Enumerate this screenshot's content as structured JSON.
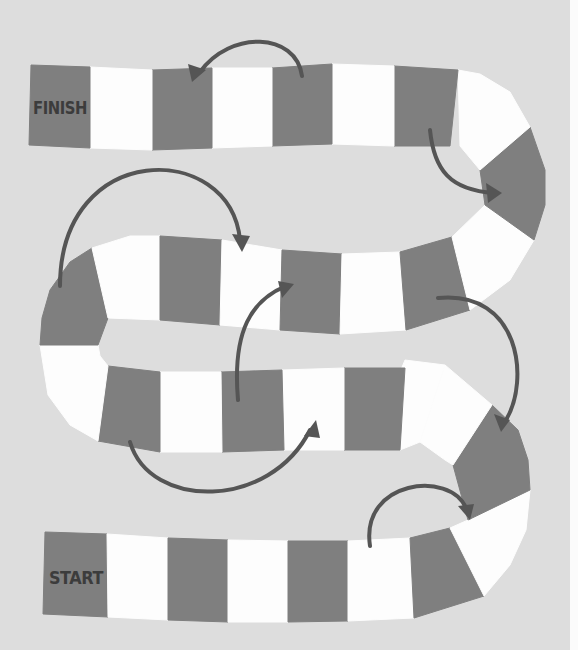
{
  "colors": {
    "background": "#dddddd",
    "dark_tile": "#7f7f7f",
    "light_tile": "#fdfdfd",
    "arrow": "#555555",
    "label": "#3c3c3c"
  },
  "labels": {
    "finish": "FINISH",
    "start": "START"
  },
  "tiles": [
    {
      "id": "start",
      "color": "dark",
      "points": "45,532 107,534 108,617 43,614",
      "label": "start"
    },
    {
      "id": "r4-2",
      "color": "light",
      "points": "107,534 168,538 168,620 108,617"
    },
    {
      "id": "r4-3",
      "color": "dark",
      "points": "168,538 228,540 228,622 168,620"
    },
    {
      "id": "r4-4",
      "color": "light",
      "points": "228,540 288,541 288,622 228,622"
    },
    {
      "id": "r4-5",
      "color": "dark",
      "points": "288,541 348,541 348,621 288,622"
    },
    {
      "id": "r4-6",
      "color": "light",
      "points": "348,541 410,538 414,618 348,621"
    },
    {
      "id": "r4-7",
      "color": "dark",
      "points": "410,538 450,528 484,596 414,618"
    },
    {
      "id": "r4-8",
      "color": "light",
      "points": "450,528 468,520 530,490 526,530 510,565 484,596"
    },
    {
      "id": "r4-9",
      "color": "dark",
      "points": "468,520 453,465 492,405 518,430 528,460 530,490"
    },
    {
      "id": "r3-9",
      "color": "light",
      "points": "453,465 445,460 420,442 445,365 492,405"
    },
    {
      "id": "r3-8",
      "color": "light",
      "points": "400,450 420,442 445,365 405,360 400,372"
    },
    {
      "id": "r3-7",
      "color": "dark",
      "points": "344,450 400,450 405,368 344,368"
    },
    {
      "id": "r3-6",
      "color": "light",
      "points": "284,450 344,450 344,368 282,370"
    },
    {
      "id": "r3-5",
      "color": "dark",
      "points": "222,452 284,450 282,370 221,372"
    },
    {
      "id": "r3-4",
      "color": "light",
      "points": "160,452 222,452 221,372 160,372"
    },
    {
      "id": "r3-3",
      "color": "dark",
      "points": "98,441 160,452 160,372 108,366"
    },
    {
      "id": "r3-2",
      "color": "light",
      "points": "40,345 98,345 100,356 108,366 98,441 70,425 48,395"
    },
    {
      "id": "r2-1",
      "color": "dark",
      "points": "40,345 98,345 108,318 92,248 70,262 50,290 42,318"
    },
    {
      "id": "r2-2",
      "color": "light",
      "points": "92,248 130,236 160,236 160,320 108,318"
    },
    {
      "id": "r2-3",
      "color": "dark",
      "points": "160,236 222,240 220,325 160,320"
    },
    {
      "id": "r2-4",
      "color": "light",
      "points": "222,240 282,250 280,330 220,325"
    },
    {
      "id": "r2-5",
      "color": "dark",
      "points": "282,250 342,254 340,334 280,330"
    },
    {
      "id": "r2-6",
      "color": "light",
      "points": "342,254 400,252 406,330 340,334"
    },
    {
      "id": "r2-7",
      "color": "dark",
      "points": "400,252 452,237 470,310 406,330"
    },
    {
      "id": "r2-8",
      "color": "light",
      "points": "452,237 485,205 534,240 510,280 470,310"
    },
    {
      "id": "r2-9",
      "color": "dark",
      "points": "485,205 480,170 530,127 545,170 545,205 534,240"
    },
    {
      "id": "r1-9",
      "color": "light",
      "points": "480,170 460,146 458,70 480,74 510,92 530,127"
    },
    {
      "id": "r1-8",
      "color": "dark",
      "points": "394,146 450,146 458,70 394,66"
    },
    {
      "id": "r1-7",
      "color": "light",
      "points": "332,144 394,146 394,66 332,64"
    },
    {
      "id": "r1-6",
      "color": "dark",
      "points": "272,146 332,144 332,64 272,68"
    },
    {
      "id": "r1-5",
      "color": "light",
      "points": "212,148 272,146 272,68 212,68"
    },
    {
      "id": "r1-4",
      "color": "dark",
      "points": "152,150 212,148 212,68 152,70"
    },
    {
      "id": "r1-3",
      "color": "light",
      "points": "90,148 152,150 152,70 90,67"
    },
    {
      "id": "finish",
      "color": "dark",
      "points": "29,145 90,148 90,67 31,65",
      "label": "finish"
    }
  ],
  "holes": [
    {
      "id": "upper-gap",
      "d": "M 100,150 L 470,150 C 500,175 480,200 450,215 C 400,235 200,230 110,235 C 60,240 40,275 40,300 Z"
    },
    {
      "id": "middle-gap",
      "d": "M 112,322 C 150,330 250,336 330,338 C 390,340 430,330 460,318 L 455,365 C 400,360 300,368 200,368 C 140,370 100,365 100,345 C 100,332 104,325 112,322 Z"
    },
    {
      "id": "lower-gap",
      "d": "M 95,445 C 150,455 250,456 340,455 C 390,455 420,458 440,470 C 470,485 470,510 445,525 C 400,538 300,538 200,535 C 100,530 60,525 40,520 Z"
    }
  ],
  "arrows": [
    {
      "id": "arrow-1",
      "from": "r1-6",
      "to": "r1-4",
      "d": "M 302,76 C 296,32 230,30 200,72",
      "head": "192,82 188,64 206,70"
    },
    {
      "id": "arrow-2",
      "from": "r1-8",
      "to": "r2-9",
      "d": "M 430,130 C 434,170 450,190 494,193",
      "head": "502,193 486,183 488,203"
    },
    {
      "id": "arrow-3",
      "from": "r2-1",
      "to": "r2-4",
      "d": "M 60,286 C 60,140 230,140 240,240",
      "head": "242,252 232,234 250,236"
    },
    {
      "id": "arrow-4",
      "from": "r3-5",
      "to": "r2-5",
      "d": "M 238,400 C 232,330 252,300 286,286",
      "head": "294,284 278,281 282,298"
    },
    {
      "id": "arrow-5",
      "from": "r2-7",
      "to": "r4-9",
      "d": "M 438,298 C 520,290 530,380 506,420",
      "head": "501,432 494,414 510,420"
    },
    {
      "id": "arrow-6",
      "from": "r3-3",
      "to": "r3-6",
      "d": "M 130,442 C 150,510 270,510 310,430",
      "head": "316,420 304,436 320,438"
    },
    {
      "id": "arrow-7",
      "from": "r4-6",
      "to": "r4-8",
      "d": "M 370,546 C 360,480 450,470 466,508",
      "head": "470,520 458,506 474,504"
    }
  ]
}
